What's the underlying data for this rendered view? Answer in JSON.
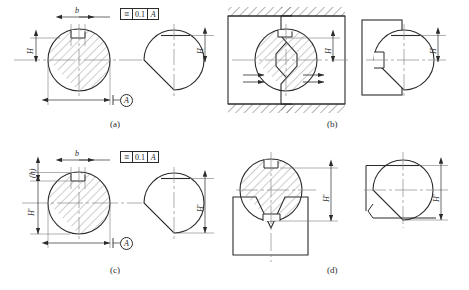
{
  "figure": {
    "background": "#ffffff",
    "line_color": "#2b2b2b",
    "centerline_color": "#8a8a8a",
    "hatch_color": "#6e6e6e"
  },
  "panels": [
    {
      "id": "a",
      "caption": "(a)",
      "fcf": {
        "symbol": "≡",
        "tolerance": "0.1",
        "datum": "A"
      },
      "datum_flag": "A",
      "dimensions": [
        {
          "name": "keyway-width",
          "label": "b"
        },
        {
          "name": "height-left",
          "label": "H"
        },
        {
          "name": "height-right",
          "label": "H"
        }
      ]
    },
    {
      "id": "b",
      "caption": "(b)",
      "dimensions": [
        {
          "name": "height-left",
          "label": "H"
        },
        {
          "name": "height-right",
          "label": "H"
        }
      ]
    },
    {
      "id": "c",
      "caption": "(c)",
      "fcf": {
        "symbol": "≡",
        "tolerance": "0.1",
        "datum": "A"
      },
      "datum_flag": "A",
      "dimensions": [
        {
          "name": "keyway-depth",
          "label": "(h)"
        },
        {
          "name": "keyway-width",
          "label": "b"
        },
        {
          "name": "height-left",
          "label": "H′"
        },
        {
          "name": "height-right",
          "label": "H′"
        }
      ]
    },
    {
      "id": "d",
      "caption": "(d)",
      "dimensions": [
        {
          "name": "height-left",
          "label": "H′"
        },
        {
          "name": "height-right",
          "label": "H′"
        }
      ]
    }
  ],
  "captions": {
    "a": "(a)",
    "b": "(b)",
    "c": "(c)",
    "d": "(d)"
  },
  "fcf_a": {
    "symbol": "≡",
    "tolerance": "0.1",
    "datum": "A"
  },
  "fcf_c": {
    "symbol": "≡",
    "tolerance": "0.1",
    "datum": "A"
  },
  "datum_a": "A",
  "datum_c": "A",
  "labels": {
    "b_a": "b",
    "H_a_left": "H",
    "H_a_right": "H",
    "H_b_left": "H",
    "H_b_right": "H",
    "h_c": "(h)",
    "b_c": "b",
    "Hp_c_left": "H′",
    "Hp_c_right": "H′",
    "Hp_d_left": "H′",
    "Hp_d_right": "H′"
  }
}
